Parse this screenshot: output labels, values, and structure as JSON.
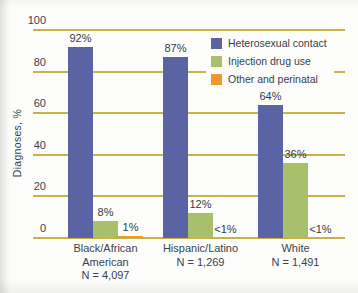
{
  "chart_data": {
    "type": "bar",
    "title": "",
    "ylabel": "Diagnoses, %",
    "xlabel": "",
    "ylim": [
      0,
      100
    ],
    "yticks": [
      0,
      20,
      40,
      60,
      80,
      100
    ],
    "grid": true,
    "grid_color": "#c9b247",
    "text_color": "#39414f",
    "legend_position": "top-right",
    "categories": [
      "Black/African American",
      "Hispanic/Latino",
      "White"
    ],
    "groups": [
      {
        "label_lines": [
          "Black/African",
          "American",
          "N = 4,097"
        ],
        "n_label": "N = 4,097"
      },
      {
        "label_lines": [
          "Hispanic/Latino",
          "N = 1,269"
        ],
        "n_label": "N = 1,269"
      },
      {
        "label_lines": [
          "White",
          "N = 1,491"
        ],
        "n_label": "N = 1,491"
      }
    ],
    "series": [
      {
        "name": "Heterosexual contact",
        "color": "#5a64a4",
        "values": [
          92,
          87,
          64
        ],
        "value_labels": [
          "92%",
          "87%",
          "64%"
        ]
      },
      {
        "name": "Injection drug use",
        "color": "#a8bf6c",
        "values": [
          8,
          12,
          36
        ],
        "value_labels": [
          "8%",
          "12%",
          "36%"
        ]
      },
      {
        "name": "Other and perinatal",
        "color": "#f2982e",
        "values": [
          1,
          0.4,
          0.4
        ],
        "value_labels": [
          "1%",
          "<1%",
          "<1%"
        ]
      }
    ]
  }
}
